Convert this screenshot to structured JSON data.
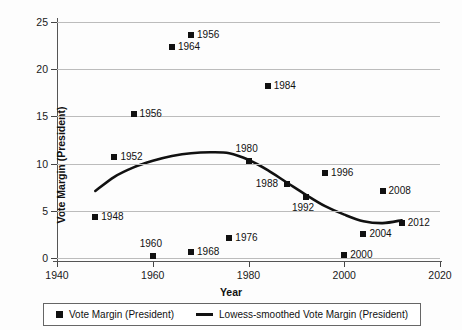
{
  "chart_data": {
    "type": "scatter",
    "title": "",
    "xlabel": "Year",
    "ylabel": "Vote Margin (President)",
    "xlim": [
      1940,
      2020
    ],
    "ylim": [
      0,
      25
    ],
    "xticks": [
      1940,
      1960,
      1980,
      2000,
      2020
    ],
    "yticks": [
      0,
      5,
      10,
      15,
      20,
      25
    ],
    "grid": true,
    "legend_position": "bottom",
    "series": [
      {
        "name": "Vote Margin (President)",
        "marker": "square",
        "color": "#111111",
        "points": [
          {
            "label": "1948",
            "x": 1948,
            "y": 4.3,
            "label_pos": "right"
          },
          {
            "label": "1952",
            "x": 1952,
            "y": 10.7,
            "label_pos": "right"
          },
          {
            "label": "1956",
            "x": 1956,
            "y": 15.3,
            "label_pos": "right"
          },
          {
            "label": "1960",
            "x": 1960,
            "y": 0.2,
            "label_pos": "above"
          },
          {
            "label": "1964",
            "x": 1964,
            "y": 22.4,
            "label_pos": "right"
          },
          {
            "label": "1956",
            "x": 1968,
            "y": 23.6,
            "label_pos": "right"
          },
          {
            "label": "1968",
            "x": 1968,
            "y": 0.6,
            "label_pos": "right"
          },
          {
            "label": "1976",
            "x": 1976,
            "y": 2.1,
            "label_pos": "right"
          },
          {
            "label": "1980",
            "x": 1980,
            "y": 10.3,
            "label_pos": "above"
          },
          {
            "label": "1984",
            "x": 1984,
            "y": 18.2,
            "label_pos": "right"
          },
          {
            "label": "1988",
            "x": 1988,
            "y": 7.8,
            "label_pos": "left"
          },
          {
            "label": "1992",
            "x": 1992,
            "y": 6.5,
            "label_pos": "below"
          },
          {
            "label": "1996",
            "x": 1996,
            "y": 9.0,
            "label_pos": "right"
          },
          {
            "label": "2000",
            "x": 2000,
            "y": 0.3,
            "label_pos": "right"
          },
          {
            "label": "2004",
            "x": 2004,
            "y": 2.5,
            "label_pos": "right"
          },
          {
            "label": "2008",
            "x": 2008,
            "y": 7.1,
            "label_pos": "right"
          },
          {
            "label": "2012",
            "x": 2012,
            "y": 3.7,
            "label_pos": "right"
          }
        ]
      },
      {
        "name": "Lowess-smoothed Vote Margin (President)",
        "marker": "line",
        "color": "#111111",
        "x": [
          1948,
          1952,
          1956,
          1960,
          1964,
          1968,
          1972,
          1976,
          1980,
          1984,
          1988,
          1992,
          1996,
          2000,
          2004,
          2008,
          2012
        ],
        "y": [
          7.1,
          8.6,
          9.6,
          10.3,
          10.8,
          11.1,
          11.2,
          11.1,
          10.4,
          9.3,
          8.0,
          6.7,
          5.5,
          4.6,
          3.9,
          3.7,
          4.0
        ]
      }
    ]
  },
  "legend": {
    "items": [
      {
        "name": "marker-entry",
        "label": "Vote Margin (President)"
      },
      {
        "name": "line-entry",
        "label": "Lowess-smoothed Vote Margin (President)"
      }
    ]
  }
}
